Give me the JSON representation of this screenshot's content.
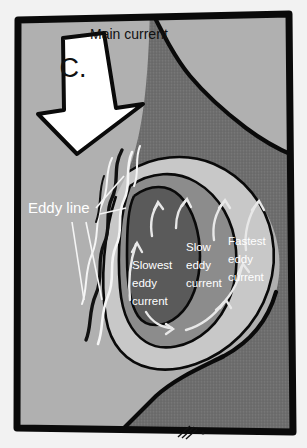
{
  "figure": {
    "panel_letter": "C.",
    "labels": {
      "main_current": "Main current",
      "eddy_line": "Eddy line",
      "slowest_eddy": [
        "Slowest",
        "eddy",
        "current"
      ],
      "slow_eddy": [
        "Slow",
        "eddy",
        "current"
      ],
      "fastest_eddy": [
        "Fastest",
        "eddy",
        "current"
      ]
    }
  },
  "colors": {
    "page_background": "#f2f2f2",
    "frame_stroke": "#0a0a0a",
    "main_current_water": "#b0b0b0",
    "landmass": "#6e6e6e",
    "eddy_fastest": "#c8c8c8",
    "eddy_slow": "#8c8c8c",
    "eddy_slowest": "#5a5a5a",
    "arrow_fill": "#ffffff",
    "arrow_stroke": "#0a0a0a",
    "label_light": "#ffffff",
    "label_dark": "#111111",
    "flow_arrow": "#e8e8e8",
    "eddy_line_white": "#f5f5f5",
    "eddy_line_black": "#111111"
  },
  "typography": {
    "main_current_size": "14px",
    "eddy_line_size": "15px",
    "zone_label_size": "11.5px",
    "panel_letter_size": "27px"
  }
}
